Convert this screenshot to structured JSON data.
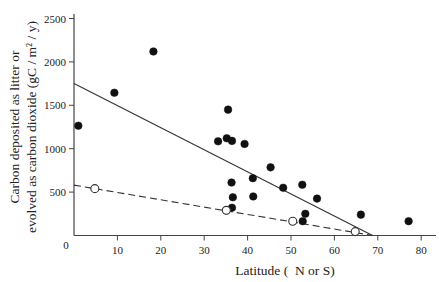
{
  "chart_data": {
    "type": "scatter",
    "title": "",
    "xlabel": "Latitude (  N or S)",
    "ylabel_lines": [
      "Carbon deposited as litter or",
      "evolved as carbon dioxide (gC / m² / y)"
    ],
    "ylabel": "Carbon deposited as litter or evolved as carbon dioxide (gC / m² / y)",
    "xlim": [
      0,
      83
    ],
    "ylim": [
      0,
      2600
    ],
    "x_ticks": [
      10,
      20,
      30,
      40,
      50,
      60,
      70,
      80
    ],
    "y_ticks": [
      500,
      1000,
      1500,
      2000,
      2500
    ],
    "origin_label": "0",
    "grid": false,
    "legend": null,
    "series": [
      {
        "name": "Carbon evolved as carbon dioxide",
        "marker": "filled-circle",
        "points": [
          {
            "x": 1.0,
            "y": 1265
          },
          {
            "x": 9.3,
            "y": 1645
          },
          {
            "x": 18.3,
            "y": 2120
          },
          {
            "x": 33.2,
            "y": 1085
          },
          {
            "x": 35.2,
            "y": 1120
          },
          {
            "x": 35.5,
            "y": 1450
          },
          {
            "x": 36.4,
            "y": 1090
          },
          {
            "x": 39.3,
            "y": 1055
          },
          {
            "x": 45.3,
            "y": 785
          },
          {
            "x": 36.3,
            "y": 610
          },
          {
            "x": 41.2,
            "y": 660
          },
          {
            "x": 36.6,
            "y": 440
          },
          {
            "x": 41.3,
            "y": 450
          },
          {
            "x": 36.4,
            "y": 320
          },
          {
            "x": 48.2,
            "y": 550
          },
          {
            "x": 52.6,
            "y": 585
          },
          {
            "x": 56.0,
            "y": 425
          },
          {
            "x": 53.3,
            "y": 250
          },
          {
            "x": 52.7,
            "y": 165
          },
          {
            "x": 66.1,
            "y": 240
          },
          {
            "x": 77.1,
            "y": 165
          }
        ],
        "fit_line": {
          "style": "solid",
          "from": {
            "x": 0,
            "y": 1750
          },
          "to": {
            "x": 68.8,
            "y": 0
          }
        }
      },
      {
        "name": "Carbon deposited as litter",
        "marker": "open-circle",
        "points": [
          {
            "x": 4.8,
            "y": 540
          },
          {
            "x": 35.1,
            "y": 290
          },
          {
            "x": 50.4,
            "y": 165
          },
          {
            "x": 64.8,
            "y": 45
          }
        ],
        "fit_line": {
          "style": "dashed",
          "from": {
            "x": 0,
            "y": 580
          },
          "to": {
            "x": 68.8,
            "y": 0
          }
        }
      }
    ]
  },
  "colors": {
    "axis": "#444444",
    "line": "#333333",
    "marker_fill": "#111111",
    "open_marker_fill": "#ffffff",
    "background": "#ffffff"
  }
}
